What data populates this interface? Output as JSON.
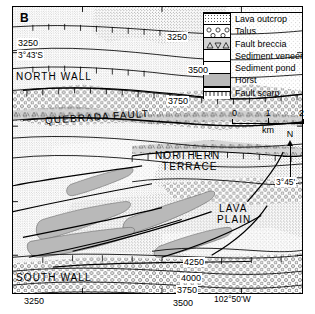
{
  "figure": {
    "panel_letter": "B",
    "type": "geologic-map"
  },
  "legend": {
    "items": [
      {
        "label": "Lava outcrop",
        "pattern": "dense-stipple",
        "swatch_class": "sw-lava"
      },
      {
        "label": "Talus",
        "pattern": "circles",
        "swatch_class": "sw-talus"
      },
      {
        "label": "Fault breccia",
        "pattern": "triangles",
        "swatch_class": "sw-breccia"
      },
      {
        "label": "Sediment veneer",
        "pattern": "fine-stipple",
        "swatch_class": "sw-veneer"
      },
      {
        "label": "Sediment pond",
        "pattern": "sparse-stipple",
        "swatch_class": "sw-pond"
      },
      {
        "label": "Horst",
        "pattern": "solid-gray",
        "swatch_class": "sw-horst"
      },
      {
        "label": "Fault scarp",
        "pattern": "hachured-line",
        "swatch_class": "sw-scarp"
      }
    ]
  },
  "scale_bar": {
    "ticks": [
      "0",
      "1",
      "2"
    ],
    "units": "km"
  },
  "north_arrow": {
    "label": "N"
  },
  "map_labels": [
    {
      "name": "north-wall",
      "text": "NORTH WALL",
      "x": 16,
      "y": 71,
      "size": "big"
    },
    {
      "name": "quebrada-fault",
      "text": "QUEBRADA  FAULT",
      "x": 45,
      "y": 115,
      "size": "big",
      "rotate": -4
    },
    {
      "name": "northern-terrace-line1",
      "text": "NORTHERN",
      "x": 155,
      "y": 150,
      "size": "big"
    },
    {
      "name": "northern-terrace-line2",
      "text": "TERRACE",
      "x": 162,
      "y": 161,
      "size": "big"
    },
    {
      "name": "lava-plain-line1",
      "text": "LAVA",
      "x": 219,
      "y": 203,
      "size": "big"
    },
    {
      "name": "lava-plain-line2",
      "text": "PLAIN",
      "x": 217,
      "y": 214,
      "size": "big"
    },
    {
      "name": "south-wall",
      "text": "SOUTH WALL",
      "x": 16,
      "y": 272,
      "size": "big"
    }
  ],
  "contour_labels": [
    {
      "name": "contour-3250-top",
      "text": "3250",
      "x": 166,
      "y": 32
    },
    {
      "name": "contour-3500-top",
      "text": "3500",
      "x": 187,
      "y": 65
    },
    {
      "name": "contour-3750-top",
      "text": "3750",
      "x": 167,
      "y": 96
    },
    {
      "name": "contour-3250-left",
      "text": "3250",
      "x": 17,
      "y": 38
    },
    {
      "name": "contour-4250-bottom",
      "text": "4250",
      "x": 183,
      "y": 257
    },
    {
      "name": "contour-4000-bottom",
      "text": "4000",
      "x": 180,
      "y": 273
    },
    {
      "name": "contour-3750-bottom",
      "text": "3750",
      "x": 176,
      "y": 285
    },
    {
      "name": "contour-3500-bottom",
      "text": "3500",
      "x": 172,
      "y": 298
    },
    {
      "name": "contour-3250-bottom",
      "text": "3250",
      "x": 23,
      "y": 296
    }
  ],
  "coordinate_labels": [
    {
      "name": "latitude-3-43-s",
      "text": "3°43'S",
      "x": 17,
      "y": 50
    },
    {
      "name": "latitude-3-45",
      "text": "3°45'",
      "x": 275,
      "y": 177
    },
    {
      "name": "longitude-102-50-w",
      "text": "102°50'W",
      "x": 213,
      "y": 294
    }
  ],
  "colors": {
    "horst_gray": "#b9b9b9",
    "pond_gray": "#d9d9d9",
    "line_black": "#000000",
    "background": "#ffffff"
  }
}
